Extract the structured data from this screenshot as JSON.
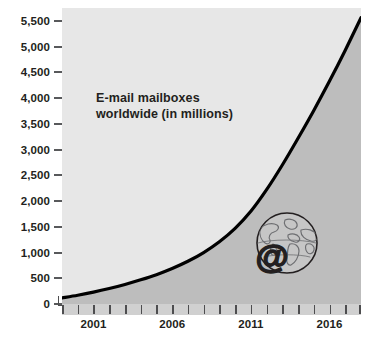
{
  "chart_data": {
    "type": "area",
    "title": "",
    "annotation": "E-mail mailboxes\nworldwide (in millions)",
    "xlabel": "",
    "ylabel": "",
    "xlim": [
      1999,
      2018
    ],
    "ylim": [
      0,
      5750
    ],
    "grid": false,
    "legend_position": "none",
    "y_ticks": [
      {
        "value": 5500,
        "label": "5,500"
      },
      {
        "value": 5000,
        "label": "5,000"
      },
      {
        "value": 4500,
        "label": "4,500"
      },
      {
        "value": 4000,
        "label": "4,000"
      },
      {
        "value": 3500,
        "label": "3,500"
      },
      {
        "value": 3000,
        "label": "3,000"
      },
      {
        "value": 2500,
        "label": "2,500"
      },
      {
        "value": 2000,
        "label": "2,000"
      },
      {
        "value": 1500,
        "label": "1,500"
      },
      {
        "value": 1000,
        "label": "1,000"
      },
      {
        "value": 500,
        "label": "500"
      },
      {
        "value": 0,
        "label": "0"
      }
    ],
    "x_ticks": [
      1999,
      2000,
      2001,
      2002,
      2003,
      2004,
      2005,
      2006,
      2007,
      2008,
      2009,
      2010,
      2011,
      2012,
      2013,
      2014,
      2015,
      2016,
      2017,
      2018
    ],
    "x_tick_labels": [
      {
        "value": 2001,
        "label": "2001"
      },
      {
        "value": 2006,
        "label": "2006"
      },
      {
        "value": 2011,
        "label": "2011"
      },
      {
        "value": 2016,
        "label": "2016"
      }
    ],
    "series": [
      {
        "name": "E-mail mailboxes worldwide (in millions)",
        "x": [
          1999,
          2000,
          2001,
          2002,
          2003,
          2004,
          2005,
          2006,
          2007,
          2008,
          2009,
          2010,
          2011,
          2012,
          2013,
          2014,
          2015,
          2016,
          2017,
          2018
        ],
        "values": [
          120,
          170,
          230,
          300,
          380,
          470,
          570,
          690,
          830,
          1000,
          1210,
          1470,
          1800,
          2220,
          2700,
          3220,
          3760,
          4330,
          4930,
          5560
        ]
      }
    ],
    "colors": {
      "plot_background": "#e7e7e7",
      "area_fill": "#bdbdbd",
      "line": "#000000",
      "tick_strip": "#d0d0d0",
      "text": "#231f20",
      "page_background": "#ffffff"
    }
  },
  "emblem": {
    "name": "globe-with-at-symbol",
    "at_symbol": "@"
  }
}
